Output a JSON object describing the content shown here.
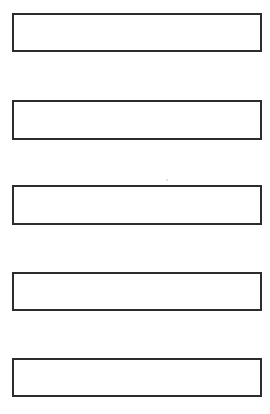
{
  "page": {
    "background_color": "#ffffff",
    "width": 270,
    "height": 414
  },
  "form": {
    "border_color": "#2c2c2c",
    "fill_color": "#ffffff",
    "border_width_px": 2,
    "fields": [
      {
        "index": 1,
        "value": "",
        "placeholder": "",
        "x": 12,
        "y": 13,
        "width": 250,
        "height": 39,
        "border_width": 2
      },
      {
        "index": 2,
        "value": "",
        "placeholder": "",
        "x": 12,
        "y": 100,
        "width": 250,
        "height": 40,
        "border_width": 2
      },
      {
        "index": 3,
        "value": "",
        "placeholder": "",
        "x": 12,
        "y": 185,
        "width": 250,
        "height": 40,
        "border_width": 2
      },
      {
        "index": 4,
        "value": "",
        "placeholder": "",
        "x": 12,
        "y": 272,
        "width": 250,
        "height": 39,
        "border_width": 2
      },
      {
        "index": 5,
        "value": "",
        "placeholder": "",
        "x": 12,
        "y": 358,
        "width": 250,
        "height": 39,
        "border_width": 2
      }
    ]
  },
  "artifacts": {
    "specks": [
      {
        "x": 166,
        "y": 179,
        "size": 2
      }
    ]
  }
}
